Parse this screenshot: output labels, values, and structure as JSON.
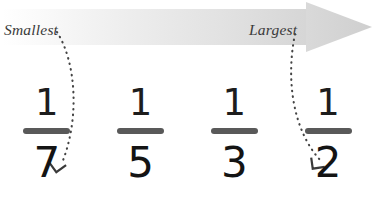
{
  "diagram": {
    "background_color": "#ffffff"
  },
  "arrow": {
    "name": "magnitude-arrow",
    "direction": "left-to-right",
    "gradient_start_color": "#ffffff",
    "gradient_end_color": "#d4d4d4",
    "labels": {
      "start": "Smallest",
      "end": "Largest"
    }
  },
  "connectors": [
    {
      "name": "smallest-connector",
      "from_label": "Smallest",
      "to_fraction": "1/7",
      "style": "dotted-curve-with-arrowhead",
      "color": "#444444"
    },
    {
      "name": "largest-connector",
      "from_label": "Largest",
      "to_fraction": "1/2",
      "style": "dotted-curve-with-arrowhead",
      "color": "#444444"
    }
  ],
  "fractions": [
    {
      "numerator": "1",
      "denominator": "7",
      "label": "one-seventh"
    },
    {
      "numerator": "1",
      "denominator": "5",
      "label": "one-fifth"
    },
    {
      "numerator": "1",
      "denominator": "3",
      "label": "one-third"
    },
    {
      "numerator": "1",
      "denominator": "2",
      "label": "one-half"
    }
  ],
  "colors": {
    "fraction_bar": "#595959",
    "digit": "#141414",
    "label_text": "#3a3a3a"
  }
}
